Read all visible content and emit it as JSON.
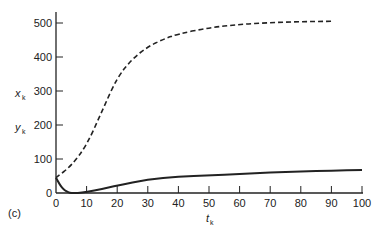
{
  "panel_label": "(c)",
  "labels": {
    "y1": "x",
    "y1_sub": "k",
    "y2": "y",
    "y2_sub": "k",
    "x": "t",
    "x_sub": "k"
  },
  "chart_data": {
    "type": "line",
    "title": "",
    "xlabel": "t_k",
    "ylabel": "x_k, y_k",
    "xlim": [
      0,
      100
    ],
    "ylim": [
      0,
      540
    ],
    "xticks": [
      0,
      10,
      20,
      30,
      40,
      50,
      60,
      70,
      80,
      90,
      100
    ],
    "yticks": [
      0,
      100,
      200,
      300,
      400,
      500
    ],
    "grid": false,
    "series": [
      {
        "name": "x_k",
        "style": "dashed",
        "x": [
          0,
          5,
          10,
          15,
          20,
          25,
          30,
          35,
          40,
          50,
          60,
          70,
          80,
          90
        ],
        "y": [
          45,
          80,
          140,
          240,
          340,
          395,
          430,
          452,
          468,
          486,
          496,
          501,
          504,
          505
        ]
      },
      {
        "name": "y_k",
        "style": "solid",
        "x": [
          0,
          1,
          2,
          3,
          4,
          5,
          7,
          10,
          15,
          20,
          30,
          40,
          50,
          60,
          70,
          80,
          90,
          100
        ],
        "y": [
          45,
          28,
          15,
          7,
          2,
          0,
          0,
          3,
          12,
          22,
          40,
          48,
          52,
          56,
          60,
          63,
          66,
          68
        ]
      }
    ]
  }
}
